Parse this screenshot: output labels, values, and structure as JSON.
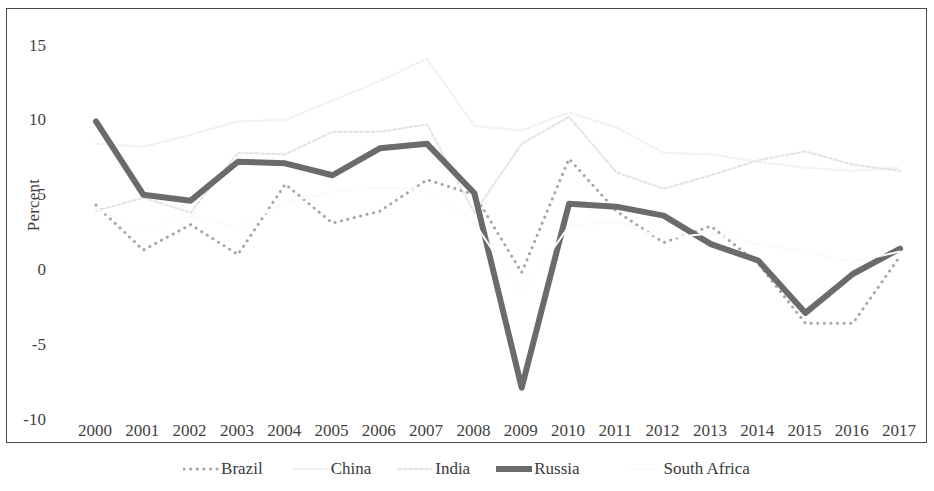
{
  "chart_data": {
    "type": "line",
    "title": "",
    "xlabel": "",
    "ylabel": "Percent",
    "x": [
      2000,
      2001,
      2002,
      2003,
      2004,
      2005,
      2006,
      2007,
      2008,
      2009,
      2010,
      2011,
      2012,
      2013,
      2014,
      2015,
      2016,
      2017
    ],
    "categories": [
      "2000",
      "2001",
      "2002",
      "2003",
      "2004",
      "2005",
      "2006",
      "2007",
      "2008",
      "2009",
      "2010",
      "2011",
      "2012",
      "2013",
      "2014",
      "2015",
      "2016",
      "2017"
    ],
    "ylim": [
      -11.5,
      17.0
    ],
    "yticks": [
      15,
      10,
      5,
      0,
      -5,
      -10
    ],
    "ytick_labels": [
      "15",
      "10",
      "5",
      "0",
      "-5",
      "-10"
    ],
    "grid": false,
    "legend_position": "bottom",
    "series": [
      {
        "name": "Brazil",
        "color": "#a6a6a6",
        "style": "dotted",
        "width": 3,
        "values": [
          4.4,
          1.4,
          3.1,
          1.1,
          5.8,
          3.2,
          4.0,
          6.1,
          5.1,
          -0.1,
          7.5,
          4.0,
          1.9,
          3.0,
          0.5,
          -3.5,
          -3.5,
          1.0
        ]
      },
      {
        "name": "China",
        "color": "#f0f0f0",
        "style": "dashed",
        "width": 2,
        "values": [
          8.5,
          8.3,
          9.1,
          10.0,
          10.1,
          11.4,
          12.7,
          14.2,
          9.7,
          9.4,
          10.6,
          9.6,
          7.9,
          7.8,
          7.3,
          6.9,
          6.7,
          6.9
        ]
      },
      {
        "name": "India",
        "color": "#e3e3e3",
        "style": "dashed",
        "width": 2,
        "values": [
          4.0,
          4.9,
          3.9,
          7.9,
          7.8,
          9.3,
          9.3,
          9.8,
          3.9,
          8.5,
          10.3,
          6.6,
          5.5,
          6.4,
          7.4,
          8.0,
          7.1,
          6.7
        ]
      },
      {
        "name": "Russia",
        "color": "#6b6b6b",
        "style": "solid",
        "width": 6,
        "values": [
          10.0,
          5.1,
          4.7,
          7.3,
          7.2,
          6.4,
          8.2,
          8.5,
          5.2,
          -7.8,
          4.5,
          4.3,
          3.7,
          1.8,
          0.7,
          -2.8,
          -0.2,
          1.5
        ]
      },
      {
        "name": "South Africa",
        "color": "#fbfbfb",
        "style": "solid",
        "width": 2,
        "values": [
          4.2,
          2.7,
          3.7,
          2.9,
          4.6,
          5.3,
          5.6,
          5.4,
          3.2,
          -1.5,
          3.0,
          3.3,
          2.2,
          2.5,
          1.8,
          1.3,
          0.6,
          1.3
        ]
      }
    ]
  },
  "legend": {
    "items": [
      {
        "label": "Brazil",
        "swatch": "dotted-line-swatch"
      },
      {
        "label": "China",
        "swatch": "dashed-line-swatch"
      },
      {
        "label": "India",
        "swatch": "dashed-line-swatch"
      },
      {
        "label": "Russia",
        "swatch": "solid-line-swatch"
      },
      {
        "label": "South Africa",
        "swatch": "solid-line-swatch"
      }
    ]
  }
}
